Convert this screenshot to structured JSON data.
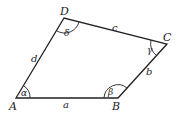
{
  "diagram": {
    "type": "quadrilateral",
    "vertices": {
      "A": {
        "label": "A",
        "x": 16,
        "y": 98
      },
      "B": {
        "label": "B",
        "x": 118,
        "y": 98
      },
      "C": {
        "label": "C",
        "x": 167,
        "y": 44
      },
      "D": {
        "label": "D",
        "x": 64,
        "y": 18
      }
    },
    "sides": {
      "a": "a",
      "b": "b",
      "c": "c",
      "d": "d"
    },
    "angles": {
      "alpha": "α",
      "beta": "β",
      "gamma": "γ",
      "delta": "δ"
    },
    "colors": {
      "stroke": "#222222",
      "background": "#ffffff"
    }
  }
}
